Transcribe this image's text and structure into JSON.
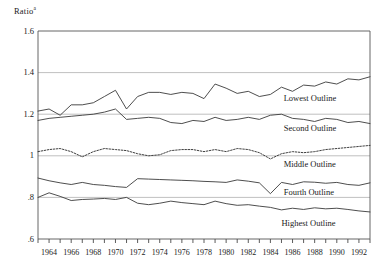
{
  "chart_data": {
    "type": "line",
    "title": "",
    "ylabel": "Ratio",
    "ylabel_superscript": "a",
    "xlabel": "",
    "ylim": [
      0.6,
      1.6
    ],
    "xlim": [
      1963,
      1993
    ],
    "grid": true,
    "gridlines_y": [
      1.6,
      1.4,
      1.2,
      1.0,
      0.8,
      0.6
    ],
    "ytick_labels": [
      "1.6",
      "1.4",
      "1.2",
      "1",
      ".8",
      ".6"
    ],
    "ytick_values": [
      1.6,
      1.4,
      1.2,
      1.0,
      0.8,
      0.6
    ],
    "xtick_labels": [
      "1964",
      "1966",
      "1968",
      "1970",
      "1972",
      "1974",
      "1976",
      "1978",
      "1980",
      "1982",
      "1984",
      "1986",
      "1988",
      "1990",
      "1992"
    ],
    "xtick_values": [
      1964,
      1966,
      1968,
      1970,
      1972,
      1974,
      1976,
      1978,
      1980,
      1982,
      1984,
      1986,
      1988,
      1990,
      1992
    ],
    "xminor_ticks": [
      1963,
      1964,
      1965,
      1966,
      1967,
      1968,
      1969,
      1970,
      1971,
      1972,
      1973,
      1974,
      1975,
      1976,
      1977,
      1978,
      1979,
      1980,
      1981,
      1982,
      1983,
      1984,
      1985,
      1986,
      1987,
      1988,
      1989,
      1990,
      1991,
      1992,
      1993
    ],
    "legend_position": "inline-right",
    "x": [
      1963,
      1964,
      1965,
      1966,
      1967,
      1968,
      1969,
      1970,
      1971,
      1972,
      1973,
      1974,
      1975,
      1976,
      1977,
      1978,
      1979,
      1980,
      1981,
      1982,
      1983,
      1984,
      1985,
      1986,
      1987,
      1988,
      1989,
      1990,
      1991,
      1992,
      1993
    ],
    "series": [
      {
        "name": "Lowest Outline",
        "style": "solid",
        "color": "#3a3a3a",
        "label": "Lowest Outline",
        "values": [
          1.215,
          1.225,
          1.195,
          1.245,
          1.245,
          1.255,
          1.285,
          1.315,
          1.225,
          1.285,
          1.305,
          1.305,
          1.295,
          1.305,
          1.3,
          1.275,
          1.345,
          1.325,
          1.3,
          1.31,
          1.285,
          1.295,
          1.33,
          1.31,
          1.34,
          1.335,
          1.355,
          1.345,
          1.37,
          1.365,
          1.38
        ]
      },
      {
        "name": "Second Outline",
        "style": "solid",
        "color": "#3a3a3a",
        "label": "Second Outline",
        "values": [
          1.17,
          1.18,
          1.185,
          1.19,
          1.195,
          1.2,
          1.21,
          1.225,
          1.175,
          1.18,
          1.185,
          1.18,
          1.16,
          1.155,
          1.17,
          1.165,
          1.185,
          1.17,
          1.175,
          1.185,
          1.175,
          1.195,
          1.2,
          1.18,
          1.175,
          1.165,
          1.18,
          1.175,
          1.16,
          1.165,
          1.155
        ]
      },
      {
        "name": "Middle Outline",
        "style": "dotted",
        "color": "#2a2a2a",
        "label": "Middle Outline",
        "values": [
          1.02,
          1.03,
          1.035,
          1.02,
          0.995,
          1.02,
          1.035,
          1.03,
          1.025,
          1.01,
          1.0,
          1.005,
          1.025,
          1.03,
          1.03,
          1.02,
          1.03,
          1.02,
          1.035,
          1.03,
          1.015,
          0.985,
          1.01,
          1.02,
          1.015,
          1.02,
          1.03,
          1.035,
          1.04,
          1.045,
          1.05
        ]
      },
      {
        "name": "Fourth Outline",
        "style": "solid",
        "color": "#3a3a3a",
        "label": "Fourth Outline",
        "values": [
          0.893,
          0.88,
          0.87,
          0.862,
          0.872,
          0.862,
          0.858,
          0.852,
          0.848,
          0.89,
          0.888,
          0.886,
          0.884,
          0.882,
          0.88,
          0.877,
          0.875,
          0.872,
          0.884,
          0.878,
          0.87,
          0.818,
          0.872,
          0.862,
          0.875,
          0.873,
          0.868,
          0.872,
          0.862,
          0.858,
          0.87
        ]
      },
      {
        "name": "Highest Outline",
        "style": "solid",
        "color": "#3a3a3a",
        "label": "Highest Outline",
        "values": [
          0.8,
          0.822,
          0.805,
          0.785,
          0.79,
          0.792,
          0.795,
          0.79,
          0.8,
          0.772,
          0.765,
          0.772,
          0.782,
          0.775,
          0.77,
          0.765,
          0.782,
          0.77,
          0.762,
          0.765,
          0.758,
          0.752,
          0.74,
          0.748,
          0.742,
          0.75,
          0.745,
          0.748,
          0.742,
          0.735,
          0.73
        ]
      }
    ],
    "annotations": [
      {
        "text": "Lowest Outline",
        "x": 1985.2,
        "y": 1.272
      },
      {
        "text": "Second Outline",
        "x": 1985.2,
        "y": 1.128
      },
      {
        "text": "Middle Outline",
        "x": 1985.2,
        "y": 0.955
      },
      {
        "text": "Fourth Outline",
        "x": 1985.2,
        "y": 0.822
      },
      {
        "text": "Highest Outline",
        "x": 1985.0,
        "y": 0.672
      }
    ]
  }
}
